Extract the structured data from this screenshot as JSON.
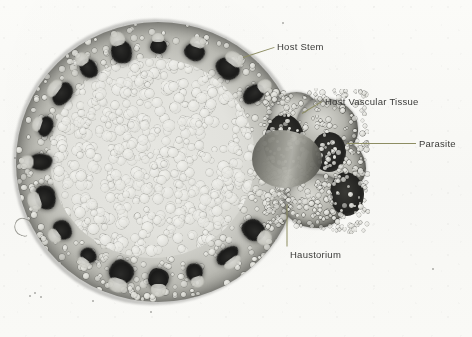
{
  "figure": {
    "kind": "light-micrograph",
    "background_color": "#fdfdfb",
    "leader_line_color": "#8d8d63",
    "label_text_color": "#3a3a38"
  },
  "annotations": [
    {
      "id": "host-stem",
      "label": "Host Stem",
      "label_x": 277,
      "label_y": 41,
      "leader": {
        "x1": 243,
        "y1": 57,
        "x2": 274,
        "y2": 47
      }
    },
    {
      "id": "host-vascular-tissue",
      "label": "Host Vascular  Tissue",
      "label_x": 325,
      "label_y": 96,
      "leader": {
        "x1": 302,
        "y1": 113,
        "x2": 322,
        "y2": 101
      }
    },
    {
      "id": "parasite",
      "label": "Parasite",
      "label_x": 419,
      "label_y": 138,
      "leader": {
        "x1": 347,
        "y1": 143,
        "x2": 416,
        "y2": 143
      }
    },
    {
      "id": "haustorium",
      "label": "Haustorium",
      "label_x": 290,
      "label_y": 249,
      "leader": {
        "x1": 287,
        "y1": 204,
        "x2": 287,
        "y2": 246
      }
    }
  ],
  "specimen": {
    "host_stem": {
      "name": "host stem",
      "center_x": 155,
      "center_y": 160,
      "radius": 143,
      "tissue_layers": [
        "epidermis",
        "cortex",
        "vascular bundle ring",
        "pith"
      ]
    },
    "vascular_bundle_count": 20,
    "parasite": {
      "name": "parasite",
      "bounds_x": 262,
      "bounds_y": 88,
      "width": 108,
      "height": 146
    },
    "haustorium": {
      "name": "haustorium",
      "bounds_x": 252,
      "bounds_y": 130,
      "width": 70,
      "height": 58
    }
  }
}
